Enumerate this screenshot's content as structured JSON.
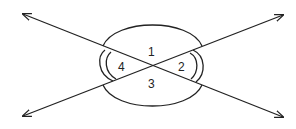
{
  "diagram": {
    "title": "",
    "angle_labels": {
      "a1": "1",
      "a2": "2",
      "a3": "3",
      "a4": "4"
    },
    "colors": {
      "stroke": "#222222",
      "background": "#ffffff"
    }
  }
}
